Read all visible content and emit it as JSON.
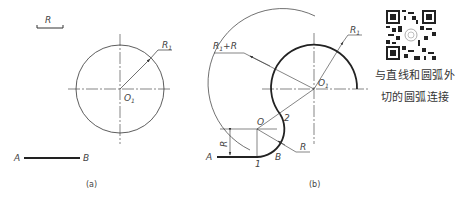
{
  "figure_a": {
    "caption": "(a)",
    "labels": {
      "R": "R",
      "R1": "R",
      "R1_sub": "1",
      "O1": "O",
      "O1_sub": "1",
      "A": "A",
      "B": "B"
    }
  },
  "figure_b": {
    "caption": "(b)",
    "labels": {
      "R1R": "R",
      "R1R_sub": "1",
      "R1R_tail": "+R",
      "R1": "R",
      "R1_sub": "1",
      "O1": "O",
      "O1_sub": "1",
      "O": "O",
      "two": "2",
      "one": "1",
      "R": "R",
      "Rdim": "R",
      "A": "A",
      "B": "B"
    }
  },
  "sidebar": {
    "qr_alt": "qr-code",
    "text_line1": "与直线和圆弧外",
    "text_line2": "切的圆弧连接"
  },
  "colors": {
    "ink": "#333333",
    "bold": "#222222"
  }
}
